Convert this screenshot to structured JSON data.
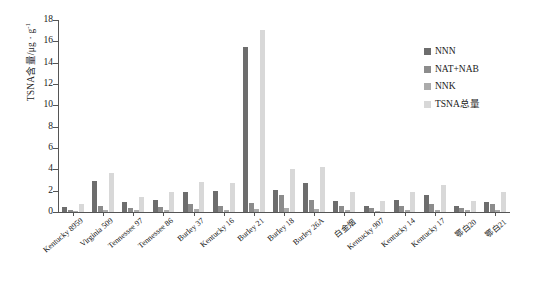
{
  "chart_data": {
    "type": "bar",
    "title": "",
    "xlabel": "",
    "ylabel": "TSNA含量/μg · g",
    "ylabel_exponent": "-1",
    "ylim": [
      0,
      18
    ],
    "yticks": [
      0,
      2,
      4,
      6,
      8,
      10,
      12,
      14,
      16,
      18
    ],
    "grid": false,
    "legend_position": "inside-top-right",
    "categories": [
      "Kentucky 8959",
      "Virginia 509",
      "Tennessee 97",
      "Tennessee 86",
      "Burley 37",
      "Kentucky 16",
      "Burley 21",
      "Burley 18",
      "Burley 26A",
      "白金烟",
      "Kentucky 907",
      "Kentucky 14",
      "Kentucky 17",
      "鄂白20",
      "鄂白21"
    ],
    "series": [
      {
        "name": "NNN",
        "color": "#6d6d6d",
        "values": [
          0.45,
          2.95,
          0.95,
          1.15,
          1.85,
          1.95,
          15.5,
          2.05,
          2.75,
          1.05,
          0.55,
          1.15,
          1.55,
          0.55,
          0.95
        ]
      },
      {
        "name": "NAT+NAB",
        "color": "#8c8c8c",
        "values": [
          0.2,
          0.55,
          0.35,
          0.5,
          0.75,
          0.6,
          0.8,
          1.6,
          1.15,
          0.6,
          0.35,
          0.55,
          0.75,
          0.35,
          0.75
        ]
      },
      {
        "name": "NNK",
        "color": "#ababab",
        "values": [
          0.1,
          0.15,
          0.15,
          0.2,
          0.25,
          0.2,
          0.25,
          0.35,
          0.3,
          0.2,
          0.1,
          0.2,
          0.2,
          0.15,
          0.2
        ]
      },
      {
        "name": "TSNA总量",
        "color": "#d8d8d8",
        "values": [
          0.75,
          3.65,
          1.45,
          1.85,
          2.85,
          2.75,
          17.1,
          4.0,
          4.2,
          1.85,
          1.0,
          1.9,
          2.5,
          1.05,
          1.9
        ]
      }
    ]
  }
}
